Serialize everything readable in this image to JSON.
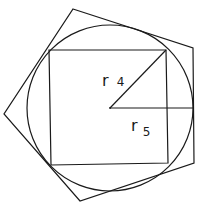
{
  "figure": {
    "stroke_color": "#1a1a1a",
    "background": "#ffffff",
    "circle": {
      "cx": 110,
      "cy": 108,
      "r": 83
    },
    "square": {
      "points": "49,50 166,50 168,163 51,165"
    },
    "pentagon": {
      "points": "73,9 193,48 194,163 80,201 4,114"
    },
    "radius_r4": {
      "x1": 110,
      "y1": 108,
      "x2": 166,
      "y2": 50
    },
    "radius_r5": {
      "x1": 110,
      "y1": 108,
      "x2": 194,
      "y2": 108
    },
    "labels": {
      "r4": {
        "letter": "r",
        "subscript": "4"
      },
      "r5": {
        "letter": "r",
        "subscript": "5"
      }
    }
  }
}
